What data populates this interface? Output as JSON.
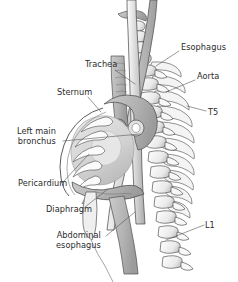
{
  "figure": {
    "width": 238,
    "height": 282,
    "background_color": "#ffffff",
    "text_color": "#2b2b2b",
    "leader_line_color": "#555555",
    "outline_color": "#4a4a4a",
    "bone_fill": "#ffffff",
    "bone_shade": "#d8d8d8",
    "soft_tissue_fill": "#b8b8b8",
    "soft_tissue_dark": "#9a9a9a",
    "heart_fill": "#dcdcdc",
    "lumen_fill": "#ededed"
  },
  "labels": [
    {
      "id": "esophagus",
      "text": "Esophagus",
      "side": "right",
      "x": 181,
      "y": 43,
      "leader": {
        "x1": 179,
        "y1": 51,
        "x2": 156,
        "y2": 66
      }
    },
    {
      "id": "aorta",
      "text": "Aorta",
      "side": "right",
      "x": 197,
      "y": 72,
      "leader": {
        "x1": 195,
        "y1": 80,
        "x2": 166,
        "y2": 92
      }
    },
    {
      "id": "t5",
      "text": "T5",
      "side": "right",
      "x": 208,
      "y": 108,
      "leader": {
        "x1": 206,
        "y1": 111,
        "x2": 187,
        "y2": 106
      }
    },
    {
      "id": "l1",
      "text": "L1",
      "side": "right",
      "x": 205,
      "y": 221,
      "leader": {
        "x1": 204,
        "y1": 225,
        "x2": 166,
        "y2": 240
      }
    },
    {
      "id": "trachea",
      "text": "Trachea",
      "side": "left",
      "x": 85,
      "y": 60,
      "leader": {
        "x1": 115,
        "y1": 70,
        "x2": 135,
        "y2": 84
      }
    },
    {
      "id": "sternum",
      "text": "Sternum",
      "side": "left",
      "x": 57,
      "y": 88,
      "leader": {
        "x1": 88,
        "y1": 97,
        "x2": 101,
        "y2": 112
      }
    },
    {
      "id": "left-main-bronchus",
      "text": "Left main\nbronchus",
      "side": "left",
      "x": 17,
      "y": 127,
      "leader": {
        "x1": 63,
        "y1": 141,
        "x2": 140,
        "y2": 134
      }
    },
    {
      "id": "pericardium",
      "text": "Pericardium",
      "side": "left",
      "x": 18,
      "y": 179,
      "leader": {
        "x1": 63,
        "y1": 182,
        "x2": 89,
        "y2": 154
      }
    },
    {
      "id": "diaphragm",
      "text": "Diaphragm",
      "side": "left",
      "x": 46,
      "y": 205,
      "leader": {
        "x1": 85,
        "y1": 207,
        "x2": 108,
        "y2": 189
      }
    },
    {
      "id": "abdominal-esophagus",
      "text": "Abdominal\nesophagus",
      "side": "left",
      "x": 56,
      "y": 231,
      "leader": {
        "x1": 106,
        "y1": 236,
        "x2": 135,
        "y2": 212
      }
    }
  ],
  "structures": [
    {
      "id": "vertebral-column",
      "name": "Vertebral column"
    },
    {
      "id": "esophagus-tube",
      "name": "Esophagus"
    },
    {
      "id": "aorta-vessel",
      "name": "Aorta"
    },
    {
      "id": "trachea-tube",
      "name": "Trachea"
    },
    {
      "id": "heart-pericardium",
      "name": "Heart and pericardium"
    },
    {
      "id": "diaphragm-muscle",
      "name": "Diaphragm"
    },
    {
      "id": "rib-cage",
      "name": "Rib cage"
    },
    {
      "id": "sternum-bone",
      "name": "Sternum"
    }
  ]
}
